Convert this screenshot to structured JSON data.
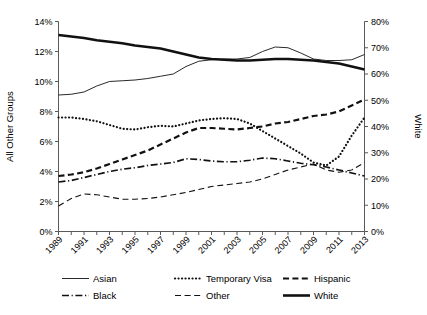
{
  "chart_data": {
    "type": "line",
    "title": "",
    "xlabel": "",
    "ylabel": "All Other Groups",
    "y2label": "White",
    "ylim": [
      0,
      14
    ],
    "y2lim": [
      0,
      80
    ],
    "grid": false,
    "legend_position": "bottom",
    "x": [
      1989,
      1990,
      1991,
      1992,
      1993,
      1994,
      1995,
      1996,
      1997,
      1998,
      1999,
      2000,
      2001,
      2002,
      2003,
      2004,
      2005,
      2006,
      2007,
      2008,
      2009,
      2010,
      2011,
      2012,
      2013
    ],
    "xtick_labels": [
      "1989",
      "1991",
      "1993",
      "1995",
      "1997",
      "1999",
      "2001",
      "2003",
      "2005",
      "2007",
      "2009",
      "2011",
      "2013"
    ],
    "ytick_labels": [
      "0%",
      "2%",
      "4%",
      "6%",
      "8%",
      "10%",
      "12%",
      "14%"
    ],
    "y2tick_labels": [
      "0%",
      "10%",
      "20%",
      "30%",
      "40%",
      "50%",
      "60%",
      "70%",
      "80%"
    ],
    "series": [
      {
        "name": "Asian",
        "style": "solid-thin",
        "axis": "left",
        "values": [
          9.1,
          9.15,
          9.3,
          9.7,
          10.0,
          10.05,
          10.1,
          10.2,
          10.35,
          10.5,
          11.0,
          11.35,
          11.45,
          11.5,
          11.5,
          11.6,
          12.0,
          12.3,
          12.25,
          11.9,
          11.5,
          11.4,
          11.4,
          11.45,
          11.8
        ]
      },
      {
        "name": "Temporary Visa",
        "style": "dotted",
        "axis": "left",
        "values": [
          7.6,
          7.6,
          7.5,
          7.35,
          7.1,
          6.85,
          6.8,
          6.95,
          7.05,
          7.0,
          7.2,
          7.4,
          7.5,
          7.55,
          7.5,
          7.2,
          6.7,
          6.2,
          5.7,
          5.2,
          4.6,
          4.4,
          5.0,
          6.4,
          7.6
        ]
      },
      {
        "name": "Hispanic",
        "style": "dashed",
        "axis": "left",
        "values": [
          3.7,
          3.8,
          3.95,
          4.2,
          4.5,
          4.8,
          5.1,
          5.4,
          5.8,
          6.2,
          6.6,
          6.9,
          6.9,
          6.85,
          6.8,
          6.9,
          7.0,
          7.2,
          7.3,
          7.5,
          7.7,
          7.8,
          8.0,
          8.4,
          8.8
        ]
      },
      {
        "name": "Black",
        "style": "dash-dot",
        "axis": "left",
        "values": [
          3.3,
          3.4,
          3.6,
          3.8,
          4.0,
          4.15,
          4.25,
          4.4,
          4.5,
          4.6,
          4.85,
          4.8,
          4.7,
          4.65,
          4.65,
          4.75,
          4.9,
          4.85,
          4.7,
          4.55,
          4.45,
          4.3,
          4.1,
          3.9,
          3.7
        ]
      },
      {
        "name": "Other",
        "style": "long-dash",
        "axis": "left",
        "values": [
          1.7,
          2.2,
          2.5,
          2.45,
          2.3,
          2.15,
          2.15,
          2.2,
          2.3,
          2.45,
          2.6,
          2.8,
          3.0,
          3.1,
          3.2,
          3.3,
          3.5,
          3.8,
          4.1,
          4.3,
          4.5,
          4.1,
          3.95,
          4.1,
          4.6
        ]
      },
      {
        "name": "White",
        "style": "solid-thick",
        "axis": "left",
        "values": [
          13.1,
          13.0,
          12.9,
          12.75,
          12.65,
          12.55,
          12.4,
          12.3,
          12.2,
          12.0,
          11.8,
          11.6,
          11.5,
          11.45,
          11.4,
          11.4,
          11.45,
          11.5,
          11.5,
          11.45,
          11.4,
          11.3,
          11.2,
          11.0,
          10.8
        ]
      }
    ]
  },
  "axes": {
    "left_title": "All Other Groups",
    "right_title": "White"
  },
  "legend": {
    "items": [
      {
        "label": "Asian",
        "style": "solid-thin"
      },
      {
        "label": "Temporary Visa",
        "style": "dotted"
      },
      {
        "label": "Hispanic",
        "style": "dashed"
      },
      {
        "label": "Black",
        "style": "dash-dot"
      },
      {
        "label": "Other",
        "style": "long-dash"
      },
      {
        "label": "White",
        "style": "solid-thick"
      }
    ]
  }
}
